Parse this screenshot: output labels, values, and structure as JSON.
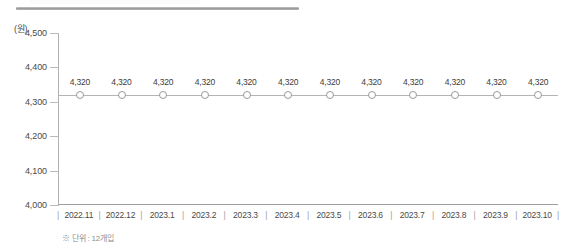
{
  "chart_data": {
    "type": "line",
    "title": "",
    "subtitle": "",
    "xlabel": "",
    "ylabel": "",
    "unit_label": "(원)",
    "categories": [
      "2022.11",
      "2022.12",
      "2023.1",
      "2023.2",
      "2023.3",
      "2023.4",
      "2023.5",
      "2023.6",
      "2023.7",
      "2023.8",
      "2023.9",
      "2023.10"
    ],
    "values": [
      4320,
      4320,
      4320,
      4320,
      4320,
      4320,
      4320,
      4320,
      4320,
      4320,
      4320,
      4320
    ],
    "point_labels": [
      "4,320",
      "4,320",
      "4,320",
      "4,320",
      "4,320",
      "4,320",
      "4,320",
      "4,320",
      "4,320",
      "4,320",
      "4,320",
      "4,320"
    ],
    "ylim": [
      4000,
      4500
    ],
    "yticks": [
      4500,
      4400,
      4300,
      4200,
      4100,
      4000
    ],
    "ytick_labels": [
      "4,500",
      "4,400",
      "4,300",
      "4,200",
      "4,100",
      "4,000"
    ],
    "grid": false,
    "legend": "none",
    "marker": "open-circle",
    "line_color": "#b4b4b4",
    "marker_edge_color": "#9b9b9b",
    "marker_fill_color": "#ffffff",
    "axis_color": "#9e9e9e",
    "text_color": "#3c3c3c"
  },
  "footnote": {
    "text": "※ 단위 : 12개입"
  },
  "decoration": {
    "top_rule_color": "#9a9a9a"
  }
}
